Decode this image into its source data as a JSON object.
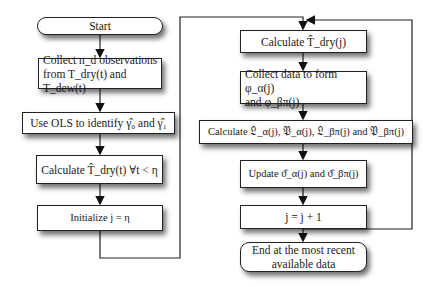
{
  "diagram": {
    "type": "flowchart",
    "left_column": [
      {
        "id": "start",
        "shape": "rounded",
        "label": "Start"
      },
      {
        "id": "collect_obs",
        "shape": "rect",
        "label": "Collect n_d observations\nfrom T_dry(t) and T_dew(t)"
      },
      {
        "id": "ols",
        "shape": "rect",
        "label": "Use OLS to identify γ̂₀ and γ̂₁"
      },
      {
        "id": "calc_tdry_t",
        "shape": "rect",
        "label": "Calculate T̂_dry(t) ∀t < η"
      },
      {
        "id": "init",
        "shape": "rect",
        "label": "Initialize j = η"
      }
    ],
    "right_column": [
      {
        "id": "calc_tdry_j",
        "shape": "rect",
        "label": "Calculate T̂_dry(j)"
      },
      {
        "id": "collect_phi",
        "shape": "rect",
        "label": "Collect data to form φ_α(j)\nand φ_βπ(j)"
      },
      {
        "id": "calc_LP",
        "shape": "rect",
        "label": "Calculate 𝔏_α(j), 𝔓_α(j), 𝔏_βπ(j) and 𝔓_βπ(j)"
      },
      {
        "id": "update",
        "shape": "rect",
        "label": "Update ϑ̂_α(j) and ϑ̂_βπ(j)"
      },
      {
        "id": "increment",
        "shape": "rect",
        "label": "j = j + 1"
      },
      {
        "id": "end",
        "shape": "rounded",
        "label": "End at the most recent\navailable data"
      }
    ],
    "edges": [
      [
        "start",
        "collect_obs"
      ],
      [
        "collect_obs",
        "ols"
      ],
      [
        "ols",
        "calc_tdry_t"
      ],
      [
        "calc_tdry_t",
        "init"
      ],
      [
        "init",
        "calc_tdry_j"
      ],
      [
        "calc_tdry_j",
        "collect_phi"
      ],
      [
        "collect_phi",
        "calc_LP"
      ],
      [
        "calc_LP",
        "update"
      ],
      [
        "update",
        "increment"
      ],
      [
        "increment",
        "calc_tdry_j"
      ],
      [
        "increment",
        "end"
      ]
    ]
  },
  "labels": {
    "start": "Start",
    "collect_obs": "Collect n_d observations\nfrom T_dry(t) and T_dew(t)",
    "ols": "Use OLS to identify γ̂₀ and γ̂₁",
    "calc_tdry_t": "Calculate T̂_dry(t) ∀t < η",
    "init": "Initialize j = η",
    "calc_tdry_j": "Calculate T̂_dry(j)",
    "collect_phi": "Collect data to form φ_α(j)\nand φ_βπ(j)",
    "calc_LP": "Calculate 𝔏_α(j), 𝔓_α(j), 𝔏_βπ(j) and 𝔓_βπ(j)",
    "update": "Update ϑ̂_α(j) and ϑ̂_βπ(j)",
    "increment": "j = j + 1",
    "end": "End at the most recent\navailable data"
  }
}
